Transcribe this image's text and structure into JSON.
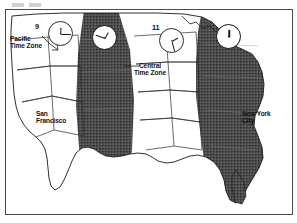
{
  "figure": {
    "type": "time-zone-map",
    "region": "Contiguous United States",
    "background_color": "#ffffff",
    "ink_color": "#1a1a1a",
    "shaded_band_color": "#4a4a4a"
  },
  "top_artifact": {
    "visible": true,
    "description": "faint cropped text fragment above map frame"
  },
  "labels": {
    "pacific": "Pacific\nTime Zone",
    "central": "Central\nTime Zone",
    "san_francisco": "San\nFrancisco",
    "new_york": "New York\nCity"
  },
  "hour_marks": {
    "pacific_hour": "9",
    "central_hour": "11"
  },
  "clocks": [
    {
      "name": "pacific-clock",
      "hour": 9,
      "minute": 0,
      "on_shaded_band": false,
      "hour_angle": 270,
      "minute_angle": 0
    },
    {
      "name": "mountain-clock",
      "hour": 10,
      "minute": 0,
      "on_shaded_band": true,
      "hour_angle": 300,
      "minute_angle": 0
    },
    {
      "name": "central-clock",
      "hour": 11,
      "minute": 0,
      "on_shaded_band": false,
      "hour_angle": 330,
      "minute_angle": 0
    },
    {
      "name": "eastern-clock",
      "hour": 12,
      "minute": 0,
      "on_shaded_band": true,
      "hour_angle": 270,
      "minute_angle": 0
    }
  ],
  "time_zones": [
    {
      "name": "Pacific Time Zone",
      "shaded": false,
      "hour": "9"
    },
    {
      "name": "Mountain Time Zone",
      "shaded": true,
      "hour": "10"
    },
    {
      "name": "Central Time Zone",
      "shaded": false,
      "hour": "11"
    },
    {
      "name": "Eastern Time Zone",
      "shaded": true,
      "hour": "12"
    }
  ],
  "cities": [
    {
      "name": "San Francisco",
      "zone": "Pacific Time Zone"
    },
    {
      "name": "New York City",
      "zone": "Eastern Time Zone"
    }
  ]
}
